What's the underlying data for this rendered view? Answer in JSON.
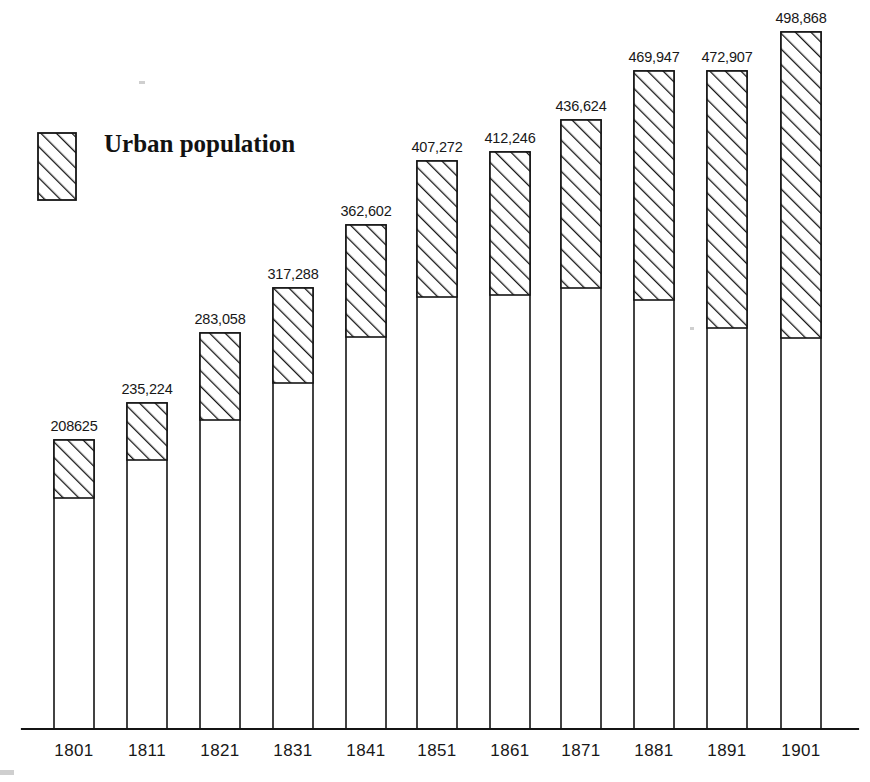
{
  "legend": {
    "label": "Urban population",
    "swatch_name": "hatched-swatch"
  },
  "axis": {
    "baseline_note": "",
    "tick_labels": [
      "1801",
      "1811",
      "1821",
      "1831",
      "1841",
      "1851",
      "1861",
      "1871",
      "1881",
      "1891",
      "1901"
    ]
  },
  "colors": {
    "ink": "#141414",
    "paper": "#ffffff",
    "hatch": "#141414"
  },
  "chart_data": {
    "type": "bar",
    "title": "",
    "subtitle": "",
    "xlabel": "",
    "ylabel": "",
    "grid": false,
    "legend_position": "top-left",
    "stacked": true,
    "note": "Stacked column chart; each column total is the labelled population, the upper hatched segment is the urban population and the lower white segment is the remainder (rural).",
    "categories": [
      "1801",
      "1811",
      "1821",
      "1831",
      "1841",
      "1851",
      "1861",
      "1871",
      "1881",
      "1891",
      "1901"
    ],
    "value_labels": [
      "208625",
      "235,224",
      "283,058",
      "317,288",
      "362,602",
      "407,272",
      "412,246",
      "436,624",
      "469,947",
      "472,907",
      "498,868"
    ],
    "values": [
      208625,
      235224,
      283058,
      317288,
      362602,
      407272,
      412246,
      436624,
      469947,
      472907,
      498868
    ],
    "series": [
      {
        "name": "Urban population",
        "pattern": "diagonal-hatch",
        "values": [
          41877,
          194224,
          223058,
          249848,
          283602,
          311890,
          313246,
          318400,
          309947,
          289455,
          282868
        ]
      },
      {
        "name": "Remainder",
        "pattern": "plain",
        "values": [
          166748,
          41000,
          60000,
          67440,
          79000,
          95382,
          99000,
          118224,
          160000,
          183452,
          216000
        ]
      }
    ],
    "ylim": [
      0,
      520000
    ],
    "geometry": {
      "baseline_y": 729,
      "axis_x_start": 22,
      "axis_x_end": 858,
      "bar_width": 40,
      "bars": [
        {
          "year": "1801",
          "x": 54,
          "top": 440,
          "split": 498
        },
        {
          "year": "1811",
          "x": 127,
          "top": 403,
          "split": 460
        },
        {
          "year": "1821",
          "x": 200,
          "top": 333,
          "split": 420
        },
        {
          "year": "1831",
          "x": 273,
          "top": 288,
          "split": 383
        },
        {
          "year": "1841",
          "x": 346,
          "top": 225,
          "split": 337
        },
        {
          "year": "1851",
          "x": 417,
          "top": 161,
          "split": 297
        },
        {
          "year": "1861",
          "x": 490,
          "top": 152,
          "split": 295
        },
        {
          "year": "1871",
          "x": 561,
          "top": 120,
          "split": 288
        },
        {
          "year": "1881",
          "x": 634,
          "top": 71,
          "split": 300
        },
        {
          "year": "1891",
          "x": 707,
          "top": 71,
          "split": 328
        },
        {
          "year": "1901",
          "x": 781,
          "top": 32,
          "split": 338
        }
      ]
    }
  }
}
